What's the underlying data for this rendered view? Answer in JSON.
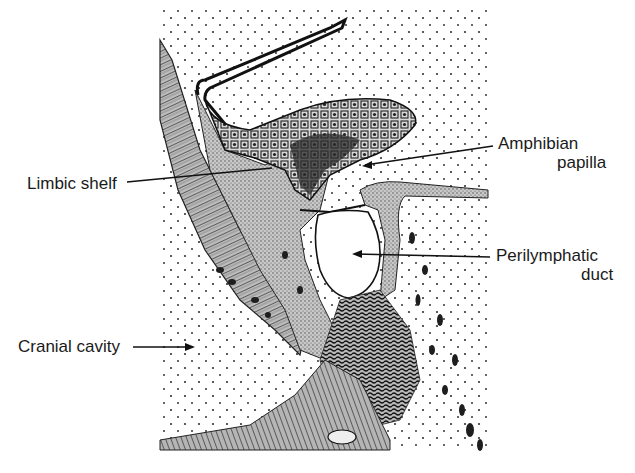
{
  "figure": {
    "labels": [
      {
        "id": "amphibian-papilla",
        "lines": [
          "Amphibian",
          "papilla"
        ]
      },
      {
        "id": "limbic-shelf",
        "lines": [
          "Limbic shelf"
        ]
      },
      {
        "id": "perilymphatic-duct",
        "lines": [
          "Perilymphatic",
          "duct"
        ]
      },
      {
        "id": "cranial-cavity",
        "lines": [
          "Cranial cavity"
        ]
      }
    ]
  },
  "colors": {
    "background": "#ffffff",
    "ink": "#1a1a1a",
    "stipple": "#333333",
    "tissue_gray": "#9a9a9a"
  }
}
